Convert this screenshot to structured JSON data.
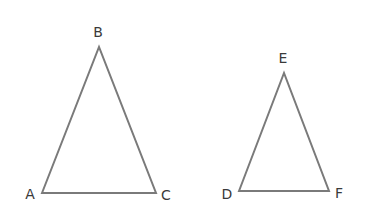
{
  "diagram": {
    "type": "two-triangles",
    "stroke_color": "#7a7a7a",
    "label_color": "#3a3a3a",
    "triangles": [
      {
        "name": "ABC",
        "vertices": [
          {
            "label": "A",
            "x": 42,
            "y": 193,
            "label_x": 30,
            "label_y": 199
          },
          {
            "label": "B",
            "x": 99,
            "y": 47,
            "label_x": 98,
            "label_y": 37
          },
          {
            "label": "C",
            "x": 156,
            "y": 193,
            "label_x": 166,
            "label_y": 200
          }
        ]
      },
      {
        "name": "DEF",
        "vertices": [
          {
            "label": "D",
            "x": 239,
            "y": 191,
            "label_x": 227,
            "label_y": 199
          },
          {
            "label": "E",
            "x": 284,
            "y": 73,
            "label_x": 283,
            "label_y": 63
          },
          {
            "label": "F",
            "x": 329,
            "y": 191,
            "label_x": 339,
            "label_y": 198
          }
        ]
      }
    ]
  }
}
